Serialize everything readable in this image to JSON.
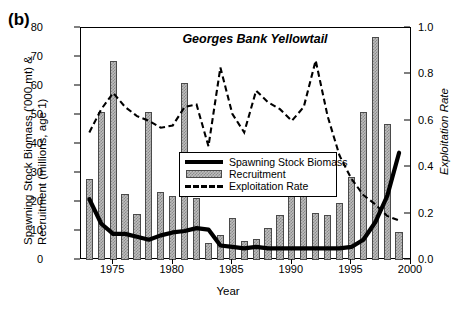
{
  "panel": {
    "label": "(b)"
  },
  "chart_data": {
    "type": "line",
    "title": "Georges Bank Yellowtail",
    "xlabel": "Year",
    "ylabel": "Spawning Stock Biomass ('000 mt) & Recruitment (millions, age 1)",
    "ylabel_line1": "Spawning Stock Biomass ('000 mt) &",
    "ylabel_line2": "Recruitment (millions, age 1)",
    "y2label": "Exploitation Rate",
    "xlim": [
      1972.3,
      2000.0
    ],
    "ylim": [
      0,
      80
    ],
    "y2lim": [
      0.0,
      1.0
    ],
    "grid": false,
    "legend_position": "center",
    "yticks": [
      0,
      10,
      20,
      30,
      40,
      50,
      60,
      70,
      80
    ],
    "y2ticks": [
      "0.0",
      "0.2",
      "0.4",
      "0.6",
      "0.8",
      "1.0"
    ],
    "y2tick_values": [
      0.0,
      0.2,
      0.4,
      0.6,
      0.8,
      1.0
    ],
    "xticks": [
      1975,
      1980,
      1985,
      1990,
      1995,
      2000
    ],
    "x": [
      1973,
      1974,
      1975,
      1976,
      1977,
      1978,
      1979,
      1980,
      1981,
      1982,
      1983,
      1984,
      1985,
      1986,
      1987,
      1988,
      1989,
      1990,
      1991,
      1992,
      1993,
      1994,
      1995,
      1996,
      1997,
      1998,
      1999
    ],
    "series": [
      {
        "name": "Recruitment",
        "type": "bar",
        "axis": "left",
        "values": [
          28,
          51,
          68.5,
          22.8,
          15.7,
          51,
          23.3,
          22,
          61,
          21.5,
          6,
          8.6,
          14.5,
          6.6,
          7.3,
          11.2,
          15.6,
          28.5,
          22,
          16.3,
          15.5,
          19.8,
          28.5,
          51,
          77,
          47,
          9.5
        ]
      },
      {
        "name": "Spawning Stock Biomass",
        "type": "line",
        "axis": "left",
        "values": [
          21,
          12.5,
          9,
          9,
          8,
          7,
          8.5,
          9.5,
          10,
          11,
          10.5,
          5,
          4.5,
          4,
          4.5,
          4,
          4,
          4,
          4,
          4,
          4,
          4,
          4.5,
          7,
          13,
          22,
          37
        ]
      },
      {
        "name": "Exploitation Rate",
        "type": "dashed-line",
        "axis": "right",
        "values": [
          0.55,
          0.65,
          0.72,
          0.66,
          0.62,
          0.6,
          0.57,
          0.58,
          0.66,
          0.67,
          0.49,
          0.83,
          0.63,
          0.55,
          0.73,
          0.68,
          0.65,
          0.6,
          0.66,
          0.86,
          0.62,
          0.45,
          0.35,
          0.28,
          0.24,
          0.19,
          0.17
        ]
      }
    ]
  },
  "legend": {
    "items": [
      {
        "label": "Spawning Stock Biomass",
        "key": "solid-line"
      },
      {
        "label": "Recruitment",
        "key": "filled-bar"
      },
      {
        "label": "Exploitation Rate",
        "key": "dashed-line"
      }
    ]
  }
}
